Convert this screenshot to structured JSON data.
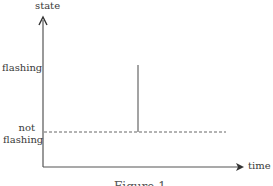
{
  "diagram": {
    "type": "state-over-time",
    "y_axis_label": "state",
    "x_axis_label": "time",
    "states": [
      {
        "label_line1": "flashing",
        "label_line2": ""
      },
      {
        "label_line1": "not",
        "label_line2": "flashing"
      }
    ],
    "baseline": {
      "state": "not flashing",
      "style": "dashed"
    },
    "event": {
      "description": "brief spike to flashing",
      "style": "solid vertical line"
    },
    "caption": "Figure 1"
  },
  "colors": {
    "axis": "#555555",
    "line": "#666666",
    "text": "#3a3a3a"
  }
}
